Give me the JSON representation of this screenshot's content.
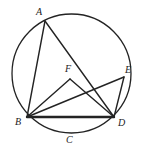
{
  "figure": {
    "background_color": "#ffffff",
    "stroke_color": "#232323",
    "label_color": "#232323",
    "canvas": {
      "width": 148,
      "height": 150
    }
  },
  "circle": {
    "name": "circumscribed-circle",
    "cx": 71.5,
    "cy": 73.5,
    "r": 59.5,
    "stroke_width": 1.3
  },
  "points": [
    {
      "id": "A",
      "label": "A",
      "px": 45,
      "py": 21,
      "label_x": 36,
      "label_y": 7,
      "on_circle": true
    },
    {
      "id": "B",
      "label": "B",
      "px": 27,
      "py": 117,
      "label_x": 15,
      "label_y": 117,
      "on_circle": true
    },
    {
      "id": "C",
      "label": "C",
      "px": 70,
      "py": 133,
      "label_x": 66,
      "label_y": 135,
      "on_circle": true
    },
    {
      "id": "D",
      "label": "D",
      "px": 114,
      "py": 117,
      "label_x": 118,
      "label_y": 118,
      "on_circle": true
    },
    {
      "id": "E",
      "label": "E",
      "px": 124,
      "py": 77,
      "label_x": 125,
      "label_y": 65,
      "on_circle": true
    },
    {
      "id": "F",
      "label": "F",
      "px": 70,
      "py": 79,
      "label_x": 65,
      "label_y": 64,
      "on_circle": false
    }
  ],
  "segments": [
    {
      "id": "AB",
      "from": "A",
      "to": "B",
      "x1": 45,
      "y1": 21,
      "x2": 27,
      "y2": 117,
      "stroke_width": 1.4
    },
    {
      "id": "AD",
      "from": "A",
      "to": "D",
      "x1": 45,
      "y1": 21,
      "x2": 114,
      "y2": 117,
      "stroke_width": 1.4
    },
    {
      "id": "BD",
      "from": "B",
      "to": "D",
      "x1": 27,
      "y1": 117,
      "x2": 114,
      "y2": 117,
      "stroke_width": 2.4
    },
    {
      "id": "BE",
      "from": "B",
      "to": "E",
      "x1": 27,
      "y1": 117,
      "x2": 124,
      "y2": 77,
      "stroke_width": 1.4
    },
    {
      "id": "ED",
      "from": "E",
      "to": "D",
      "x1": 124,
      "y1": 77,
      "x2": 114,
      "y2": 117,
      "stroke_width": 1.4
    },
    {
      "id": "FB",
      "from": "F",
      "to": "B",
      "x1": 70,
      "y1": 79,
      "x2": 27,
      "y2": 117,
      "stroke_width": 1.4
    },
    {
      "id": "FD",
      "from": "F",
      "to": "D",
      "x1": 70,
      "y1": 79,
      "x2": 114,
      "y2": 117,
      "stroke_width": 1.4
    }
  ]
}
